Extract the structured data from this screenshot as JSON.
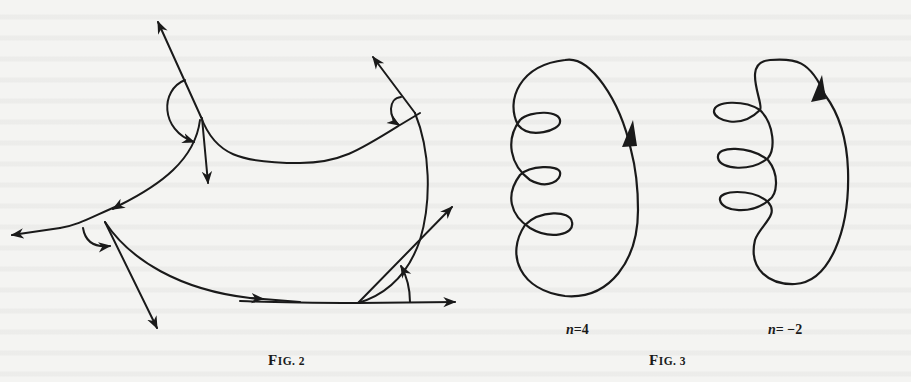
{
  "figure2": {
    "caption": "Fig. 2",
    "caption_prefix": "F",
    "caption_rest": "IG. 2",
    "description": "Piecewise smooth curves with cusps/corners; tangent vectors and turning-angle arcs drawn at each vertex"
  },
  "figure3": {
    "caption": "Fig. 3",
    "caption_prefix": "F",
    "caption_rest": "IG. 3",
    "curves": [
      {
        "label": "n=4",
        "n_var": "n",
        "n_value": "=4",
        "loops": 3,
        "orientation": "counterclockwise arrow on right side"
      },
      {
        "label": "n=−2",
        "n_var": "n",
        "n_value": "= −2",
        "loops": 3,
        "orientation": "loops on left, arrow on right side"
      }
    ]
  },
  "colors": {
    "ink": "#1a1a1a",
    "paper": "#f4f4f2"
  }
}
